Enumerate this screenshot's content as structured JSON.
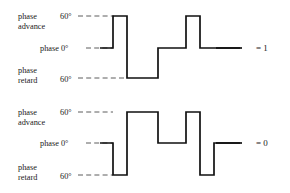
{
  "figure": {
    "line_color": "#111111",
    "reference_line_color": "#4a4a4a",
    "background": "#ffffff"
  },
  "groups": [
    {
      "id": "top",
      "result_label": "= 1",
      "levels": [
        {
          "id": "advance",
          "name_line1": "phase",
          "name_line2": "advance",
          "value": "60°",
          "y": 16
        },
        {
          "id": "zero",
          "name_line1": "phase 0°",
          "name_line2": "",
          "value": "",
          "y": 48
        },
        {
          "id": "retard",
          "name_line1": "phase",
          "name_line2": "retard",
          "value": "60°",
          "y": 78
        }
      ],
      "reference_lines": [
        {
          "level": "advance",
          "x1": 78,
          "x2": 114,
          "y": 16
        },
        {
          "level": "zero",
          "x1": 86,
          "x2": 113,
          "y": 48
        },
        {
          "level": "retard",
          "x1": 78,
          "x2": 127,
          "y": 78
        }
      ],
      "waveform_points": "100,48 113,48 113,16 127,16 127,78 158,78 158,48 186,48 186,16 200,16 200,48 240,48",
      "result_tick": {
        "x1": 216,
        "x2": 242,
        "y": 48
      },
      "result_x": 262,
      "result_y": 51
    },
    {
      "id": "bottom",
      "result_label": "= 0",
      "levels": [
        {
          "id": "advance",
          "name_line1": "phase",
          "name_line2": "advance",
          "value": "60°",
          "y": 112
        },
        {
          "id": "zero",
          "name_line1": "phase 0°",
          "name_line2": "",
          "value": "",
          "y": 143
        },
        {
          "id": "retard",
          "name_line1": "phase",
          "name_line2": "retard",
          "value": "60°",
          "y": 175
        }
      ],
      "reference_lines": [
        {
          "level": "advance",
          "x1": 78,
          "x2": 113,
          "y": 112
        },
        {
          "level": "zero",
          "x1": 86,
          "x2": 113,
          "y": 143
        },
        {
          "level": "retard",
          "x1": 78,
          "x2": 113,
          "y": 175
        }
      ],
      "waveform_points": "100,143 113,143 113,175 127,175 127,112 158,112 158,143 186,143 186,112 200,112 200,175 214,175 214,143 240,143",
      "result_tick": {
        "x1": 216,
        "x2": 242,
        "y": 143
      },
      "result_x": 262,
      "result_y": 146
    }
  ],
  "labels": {
    "top_advance_line1": "phase",
    "top_advance_line2": "advance",
    "top_advance_value": "60°",
    "top_zero": "phase 0°",
    "top_retard_line1": "phase",
    "top_retard_line2": "retard",
    "top_retard_value": "60°",
    "top_result": "= 1",
    "bottom_advance_line1": "phase",
    "bottom_advance_line2": "advance",
    "bottom_advance_value": "60°",
    "bottom_zero": "phase 0°",
    "bottom_retard_line1": "phase",
    "bottom_retard_line2": "retard",
    "bottom_retard_value": "60°",
    "bottom_result": "= 0"
  }
}
